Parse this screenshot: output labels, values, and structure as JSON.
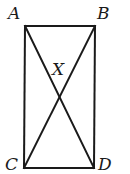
{
  "diagram": {
    "type": "rectangle-with-diagonals",
    "points": {
      "A": {
        "label": "A",
        "x": 25,
        "y": 26
      },
      "B": {
        "label": "B",
        "x": 95,
        "y": 26
      },
      "C": {
        "label": "C",
        "x": 24,
        "y": 168
      },
      "D": {
        "label": "D",
        "x": 94,
        "y": 168
      },
      "X": {
        "label": "X",
        "x": 59,
        "y": 97
      }
    },
    "segments": [
      "AB",
      "BD",
      "DC",
      "CA",
      "AD",
      "BC"
    ],
    "stroke_color": "#1a1a1a"
  }
}
